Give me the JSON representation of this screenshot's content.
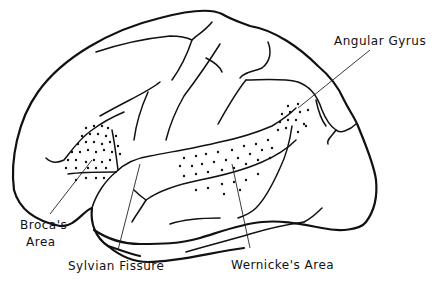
{
  "diagram": {
    "labels": {
      "angular_gyrus": "Angular Gyrus",
      "broca_line1": "Broca's",
      "broca_line2": "Area",
      "sylvian_fissure": "Sylvian Fissure",
      "wernicke": "Wernicke's  Area"
    },
    "colors": {
      "stroke": "#111111",
      "background": "#ffffff"
    }
  }
}
